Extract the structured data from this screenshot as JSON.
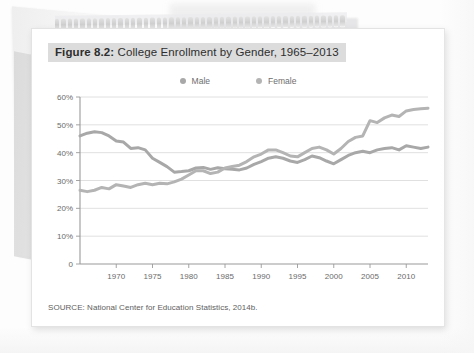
{
  "figure": {
    "label": "Figure 8.2:",
    "title_rest": " College Enrollment by Gender, 1965–2013",
    "source": "SOURCE: National Center for Education Statistics, 2014b."
  },
  "colors": {
    "male_line": "#a8a8a8",
    "female_line": "#b4b4b4",
    "title_highlight": "#dcdcdc",
    "grid": "#d8d8d8",
    "axis": "#9a9a9a",
    "tick_text": "#6b6b6b",
    "card": "#ffffff",
    "page": "#fdfdfd"
  },
  "chart_data": {
    "type": "line",
    "title": "Figure 8.2: College Enrollment by Gender, 1965–2013",
    "xlabel": "",
    "ylabel": "",
    "ylim": [
      0,
      60
    ],
    "xlim": [
      1965,
      2013
    ],
    "grid": true,
    "legend_position": "top-center",
    "ytick_labels": [
      "0",
      "10%",
      "20%",
      "30%",
      "40%",
      "50%",
      "60%"
    ],
    "ytick_values": [
      0,
      10,
      20,
      30,
      40,
      50,
      60
    ],
    "xtick_labels": [
      "1970",
      "1975",
      "1980",
      "1985",
      "1990",
      "1995",
      "2000",
      "2005",
      "2010"
    ],
    "xtick_values": [
      1970,
      1975,
      1980,
      1985,
      1990,
      1995,
      2000,
      2005,
      2010
    ],
    "x": [
      1965,
      1966,
      1967,
      1968,
      1969,
      1970,
      1971,
      1972,
      1973,
      1974,
      1975,
      1976,
      1977,
      1978,
      1979,
      1980,
      1981,
      1982,
      1983,
      1984,
      1985,
      1986,
      1987,
      1988,
      1989,
      1990,
      1991,
      1992,
      1993,
      1994,
      1995,
      1996,
      1997,
      1998,
      1999,
      2000,
      2001,
      2002,
      2003,
      2004,
      2005,
      2006,
      2007,
      2008,
      2009,
      2010,
      2011,
      2012,
      2013
    ],
    "series": [
      {
        "name": "Male",
        "color": "#a8a8a8",
        "values": [
          46.0,
          47.0,
          47.5,
          47.2,
          46.0,
          44.2,
          43.8,
          41.5,
          41.8,
          41.0,
          38.0,
          36.5,
          35.0,
          33.0,
          33.2,
          33.5,
          34.5,
          34.7,
          34.0,
          34.6,
          34.2,
          34.0,
          33.8,
          34.5,
          35.8,
          36.8,
          38.0,
          38.5,
          38.0,
          37.0,
          36.5,
          37.5,
          38.8,
          38.2,
          37.0,
          36.0,
          37.5,
          39.0,
          40.0,
          40.5,
          40.0,
          41.0,
          41.5,
          41.8,
          41.0,
          42.5,
          42.0,
          41.5,
          42.0
        ]
      },
      {
        "name": "Female",
        "color": "#b4b4b4",
        "values": [
          26.5,
          26.0,
          26.5,
          27.5,
          27.0,
          28.5,
          28.0,
          27.5,
          28.5,
          29.0,
          28.5,
          29.0,
          28.8,
          29.5,
          30.5,
          32.0,
          33.5,
          33.5,
          32.5,
          33.0,
          34.5,
          35.0,
          35.5,
          36.8,
          38.5,
          39.5,
          41.0,
          41.0,
          40.0,
          38.8,
          38.5,
          40.0,
          41.5,
          42.0,
          41.0,
          39.5,
          41.5,
          44.0,
          45.5,
          46.0,
          51.5,
          50.8,
          52.5,
          53.5,
          53.0,
          55.0,
          55.5,
          55.8,
          56.0
        ]
      }
    ]
  }
}
